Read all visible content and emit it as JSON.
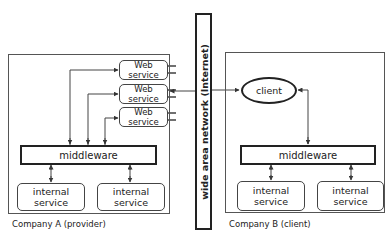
{
  "diagram": {
    "network": {
      "label": "wide area network (Internet)"
    },
    "company_a": {
      "caption": "Company A (provider)",
      "web_services": [
        {
          "line1": "Web",
          "line2": "service"
        },
        {
          "line1": "Web",
          "line2": "service"
        },
        {
          "line1": "Web",
          "line2": "service"
        }
      ],
      "middleware": "middleware",
      "internal_services": [
        {
          "line1": "internal",
          "line2": "service"
        },
        {
          "line1": "internal",
          "line2": "service"
        }
      ]
    },
    "company_b": {
      "caption": "Company B (client)",
      "client": "client",
      "middleware": "middleware",
      "internal_services": [
        {
          "line1": "internal",
          "line2": "service"
        },
        {
          "line1": "internal",
          "line2": "service"
        }
      ]
    },
    "colors": {
      "stroke": "#222222",
      "container_stroke": "#555555",
      "background": "#ffffff"
    }
  }
}
